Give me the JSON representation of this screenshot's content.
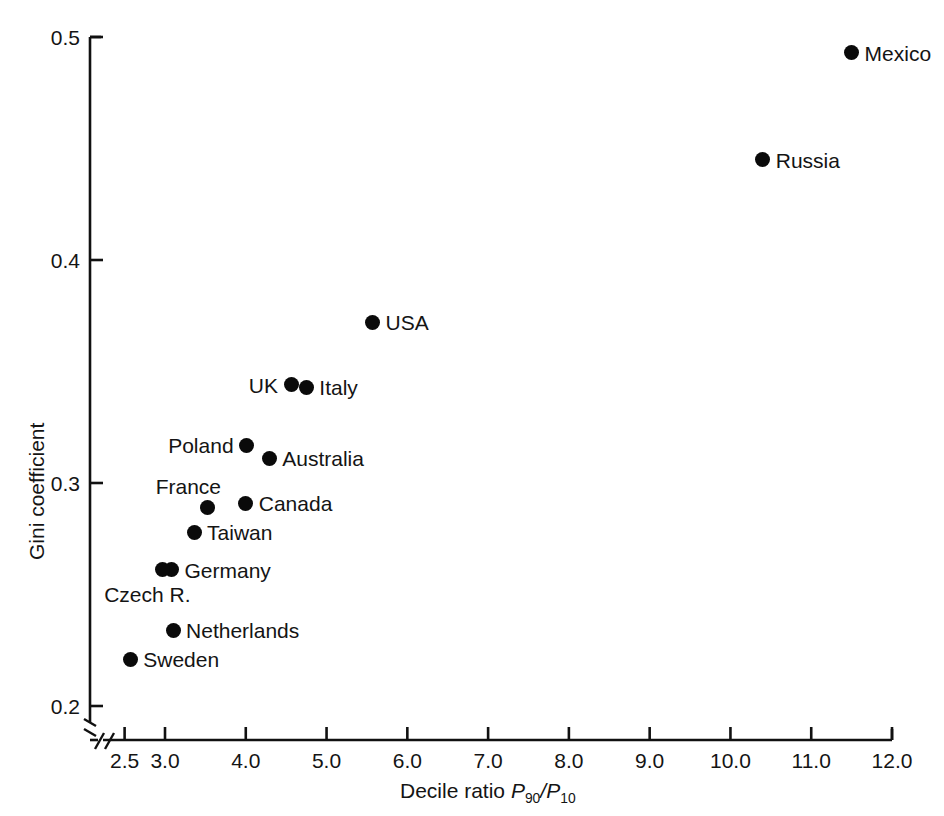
{
  "chart_data": {
    "type": "scatter",
    "title": "",
    "xlabel": "Decile ratio P90/P10",
    "ylabel": "Gini coefficient",
    "xlim": [
      2.25,
      12.0
    ],
    "ylim": [
      0.195,
      0.5
    ],
    "grid": false,
    "legend": "none",
    "axis_break": {
      "x": true,
      "y": true
    },
    "xticks": [
      "2.5",
      "3.0",
      "4.0",
      "5.0",
      "6.0",
      "7.0",
      "8.0",
      "9.0",
      "10.0",
      "11.0",
      "12.0"
    ],
    "xtick_values": [
      2.5,
      3.0,
      4.0,
      5.0,
      6.0,
      7.0,
      8.0,
      9.0,
      10.0,
      11.0,
      12.0
    ],
    "yticks": [
      "0.2",
      "0.3",
      "0.4",
      "0.5"
    ],
    "ytick_values": [
      0.2,
      0.3,
      0.4,
      0.5
    ],
    "points": [
      {
        "label": "Mexico",
        "x": 11.5,
        "y": 0.493,
        "label_side": "right"
      },
      {
        "label": "Russia",
        "x": 10.4,
        "y": 0.445,
        "label_side": "right"
      },
      {
        "label": "USA",
        "x": 5.57,
        "y": 0.372,
        "label_side": "right"
      },
      {
        "label": "UK",
        "x": 4.56,
        "y": 0.344,
        "label_side": "left"
      },
      {
        "label": "Italy",
        "x": 4.75,
        "y": 0.343,
        "label_side": "right"
      },
      {
        "label": "Poland",
        "x": 4.01,
        "y": 0.317,
        "label_side": "left"
      },
      {
        "label": "Australia",
        "x": 4.29,
        "y": 0.311,
        "label_side": "right"
      },
      {
        "label": "France",
        "x": 3.52,
        "y": 0.289,
        "label_side": "above-left"
      },
      {
        "label": "Canada",
        "x": 4.0,
        "y": 0.291,
        "label_side": "right"
      },
      {
        "label": "Taiwan",
        "x": 3.36,
        "y": 0.278,
        "label_side": "right"
      },
      {
        "label": "Germany",
        "x": 3.08,
        "y": 0.261,
        "label_side": "right"
      },
      {
        "label": "Czech R.",
        "x": 2.97,
        "y": 0.261,
        "label_side": "below-left"
      },
      {
        "label": "Netherlands",
        "x": 3.1,
        "y": 0.234,
        "label_side": "right"
      },
      {
        "label": "Sweden",
        "x": 2.57,
        "y": 0.221,
        "label_side": "right"
      }
    ]
  },
  "axis": {
    "y_title": "Gini coefficient",
    "x_title_prefix": "Decile ratio ",
    "x_title_p": "P",
    "x_title_sub1": "90",
    "x_title_slash": "/",
    "x_title_p2": "P",
    "x_title_sub2": "10"
  },
  "colors": {
    "marker": "#0a0a0a",
    "axis": "#111111",
    "text": "#141414",
    "background": "#ffffff"
  }
}
